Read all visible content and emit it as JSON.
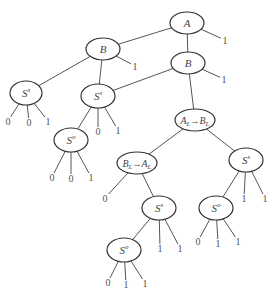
{
  "diagram": {
    "type": "tree",
    "nodes": [
      {
        "id": "n_A",
        "label": "A",
        "sup": "",
        "x": 187,
        "y": 23,
        "rx": 17,
        "ry": 11
      },
      {
        "id": "n_B_right",
        "label": "B",
        "sup": "",
        "x": 188,
        "y": 63,
        "rx": 17,
        "ry": 11
      },
      {
        "id": "n_B_left",
        "label": "B",
        "sup": "",
        "x": 103,
        "y": 49,
        "rx": 17,
        "ry": 11
      },
      {
        "id": "n_Ss_left",
        "label": "S",
        "sup": "s",
        "x": 26,
        "y": 93,
        "rx": 16,
        "ry": 12
      },
      {
        "id": "n_Ss_mid",
        "label": "S",
        "sup": "s",
        "x": 98,
        "y": 96,
        "rx": 17,
        "ry": 12
      },
      {
        "id": "n_So_a",
        "label": "S",
        "sup": "o",
        "x": 71,
        "y": 140,
        "rx": 17,
        "ry": 12
      },
      {
        "id": "n_AL_BL",
        "label": "A_L→B_L",
        "sup": "",
        "x": 195,
        "y": 120,
        "rx": 20,
        "ry": 11
      },
      {
        "id": "n_BL_AL",
        "label": "B_L→A_L",
        "sup": "",
        "x": 137,
        "y": 163,
        "rx": 20,
        "ry": 11
      },
      {
        "id": "n_Ss_c",
        "label": "S",
        "sup": "s",
        "x": 159,
        "y": 208,
        "rx": 17,
        "ry": 12
      },
      {
        "id": "n_So_c",
        "label": "S",
        "sup": "o",
        "x": 124,
        "y": 250,
        "rx": 17,
        "ry": 12
      },
      {
        "id": "n_Ss_right",
        "label": "S",
        "sup": "s",
        "x": 246,
        "y": 160,
        "rx": 17,
        "ry": 12
      },
      {
        "id": "n_So_right",
        "label": "S",
        "sup": "o",
        "x": 216,
        "y": 208,
        "rx": 17,
        "ry": 12
      }
    ],
    "edges": [
      {
        "from": "n_A",
        "to": "n_B_left"
      },
      {
        "from": "n_A",
        "to": "n_B_right"
      },
      {
        "from": "n_A",
        "to": "leaf_A_1"
      },
      {
        "from": "n_B_right",
        "to": "n_Ss_mid"
      },
      {
        "from": "n_B_right",
        "to": "n_AL_BL"
      },
      {
        "from": "n_B_right",
        "to": "leaf_Br_1"
      },
      {
        "from": "n_B_left",
        "to": "n_Ss_left"
      },
      {
        "from": "n_B_left",
        "to": "n_Ss_mid"
      },
      {
        "from": "n_B_left",
        "to": "leaf_Bl_1"
      },
      {
        "from": "n_Ss_left",
        "to": "leaf_SsL_0a"
      },
      {
        "from": "n_Ss_left",
        "to": "leaf_SsL_0b"
      },
      {
        "from": "n_Ss_left",
        "to": "leaf_SsL_1"
      },
      {
        "from": "n_Ss_mid",
        "to": "n_So_a"
      },
      {
        "from": "n_Ss_mid",
        "to": "leaf_SsM_0"
      },
      {
        "from": "n_Ss_mid",
        "to": "leaf_SsM_1"
      },
      {
        "from": "n_So_a",
        "to": "leaf_SoA_0a"
      },
      {
        "from": "n_So_a",
        "to": "leaf_SoA_0b"
      },
      {
        "from": "n_So_a",
        "to": "leaf_SoA_1"
      },
      {
        "from": "n_AL_BL",
        "to": "n_BL_AL"
      },
      {
        "from": "n_AL_BL",
        "to": "n_Ss_right"
      },
      {
        "from": "n_BL_AL",
        "to": "leaf_BLAL_0"
      },
      {
        "from": "n_BL_AL",
        "to": "n_Ss_c"
      },
      {
        "from": "n_Ss_c",
        "to": "n_So_c"
      },
      {
        "from": "n_Ss_c",
        "to": "leaf_SsC_1a"
      },
      {
        "from": "n_Ss_c",
        "to": "leaf_SsC_1b"
      },
      {
        "from": "n_So_c",
        "to": "leaf_SoC_0"
      },
      {
        "from": "n_So_c",
        "to": "leaf_SoC_1a"
      },
      {
        "from": "n_So_c",
        "to": "leaf_SoC_1b"
      },
      {
        "from": "n_Ss_right",
        "to": "n_So_right"
      },
      {
        "from": "n_Ss_right",
        "to": "leaf_SsR_1a"
      },
      {
        "from": "n_Ss_right",
        "to": "leaf_SsR_1b"
      },
      {
        "from": "n_So_right",
        "to": "leaf_SoR_0"
      },
      {
        "from": "n_So_right",
        "to": "leaf_SoR_1a"
      },
      {
        "from": "n_So_right",
        "to": "leaf_SoR_1b"
      }
    ],
    "leaves": [
      {
        "id": "leaf_A_1",
        "label": "1",
        "x": 225,
        "y": 44
      },
      {
        "id": "leaf_Br_1",
        "label": "1",
        "x": 224,
        "y": 83
      },
      {
        "id": "leaf_Bl_1",
        "label": "1",
        "x": 135,
        "y": 70
      },
      {
        "id": "leaf_SsL_0a",
        "label": "0",
        "x": 8,
        "y": 125
      },
      {
        "id": "leaf_SsL_0b",
        "label": "0",
        "x": 29,
        "y": 126
      },
      {
        "id": "leaf_SsL_1",
        "label": "1",
        "x": 48,
        "y": 125
      },
      {
        "id": "leaf_SsM_0",
        "label": "0",
        "x": 98,
        "y": 135
      },
      {
        "id": "leaf_SsM_1",
        "label": "1",
        "x": 118,
        "y": 134
      },
      {
        "id": "leaf_SoA_0a",
        "label": "0",
        "x": 52,
        "y": 181
      },
      {
        "id": "leaf_SoA_0b",
        "label": "0",
        "x": 71,
        "y": 182
      },
      {
        "id": "leaf_SoA_1",
        "label": "1",
        "x": 91,
        "y": 181
      },
      {
        "id": "leaf_BLAL_0",
        "label": "0",
        "x": 105,
        "y": 202
      },
      {
        "id": "leaf_SsC_1a",
        "label": "1",
        "x": 160,
        "y": 252
      },
      {
        "id": "leaf_SsC_1b",
        "label": "1",
        "x": 180,
        "y": 252
      },
      {
        "id": "leaf_SoC_0",
        "label": "0",
        "x": 108,
        "y": 286
      },
      {
        "id": "leaf_SoC_1a",
        "label": "1",
        "x": 126,
        "y": 288
      },
      {
        "id": "leaf_SoC_1b",
        "label": "1",
        "x": 145,
        "y": 287
      },
      {
        "id": "leaf_SsR_1a",
        "label": "1",
        "x": 244,
        "y": 202
      },
      {
        "id": "leaf_SsR_1b",
        "label": "1",
        "x": 265,
        "y": 202
      },
      {
        "id": "leaf_SoR_0",
        "label": "0",
        "x": 198,
        "y": 245
      },
      {
        "id": "leaf_SoR_1a",
        "label": "1",
        "x": 218,
        "y": 247
      },
      {
        "id": "leaf_SoR_1b",
        "label": "1",
        "x": 238,
        "y": 245
      }
    ]
  }
}
